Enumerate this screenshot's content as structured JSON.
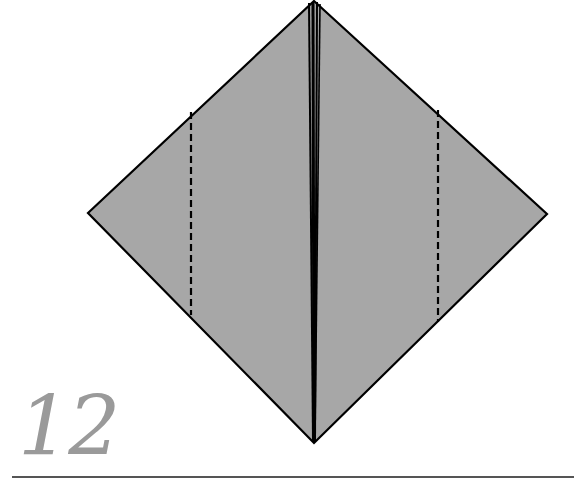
{
  "step": {
    "number": "12"
  },
  "colors": {
    "paper_fill": "#a7a7a7",
    "outline": "#000000",
    "step_number": "#9a9a9a",
    "rule": "#555555"
  },
  "diagram": {
    "shape": "kite/diamond square base",
    "outline_points": [
      [
        314,
        1
      ],
      [
        547,
        214
      ],
      [
        314,
        443
      ],
      [
        88,
        213
      ]
    ],
    "center_lines_x": [
      309,
      313,
      317,
      320
    ],
    "valley_fold_lines": [
      {
        "name": "left-valley-fold",
        "x": 191,
        "y1": 112,
        "y2": 315
      },
      {
        "name": "right-valley-fold",
        "x": 438,
        "y1": 110,
        "y2": 322
      }
    ]
  }
}
